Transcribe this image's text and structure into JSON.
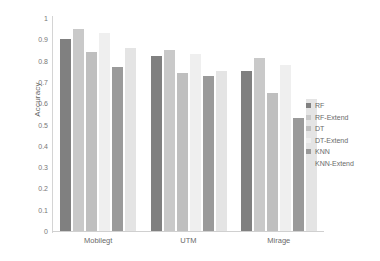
{
  "chart_data": {
    "type": "bar",
    "title": "",
    "xlabel": "",
    "ylabel": "Accuracy",
    "ylim": [
      0,
      1
    ],
    "ytick_labels": [
      "1",
      "0.9",
      "0.8",
      "0.7",
      "0.6",
      "0.5",
      "0.4",
      "0.3",
      "0.2",
      "0.1",
      "0"
    ],
    "ytick_values": [
      1,
      0.9,
      0.8,
      0.7,
      0.6,
      0.5,
      0.4,
      0.3,
      0.2,
      0.1,
      0
    ],
    "grid": false,
    "legend_position": "right",
    "categories": [
      "Mobilegt",
      "UTM",
      "Mirage"
    ],
    "series": [
      {
        "name": "RF",
        "color": "#808080",
        "values": [
          0.9,
          0.82,
          0.75
        ]
      },
      {
        "name": "RF-Extend",
        "color": "#c9c9c9",
        "values": [
          0.95,
          0.85,
          0.81
        ]
      },
      {
        "name": "DT",
        "color": "#bfbfbf",
        "values": [
          0.84,
          0.74,
          0.65
        ]
      },
      {
        "name": "DT-Extend",
        "color": "#efefef",
        "values": [
          0.93,
          0.83,
          0.78
        ]
      },
      {
        "name": "KNN",
        "color": "#9a9a9a",
        "values": [
          0.77,
          0.73,
          0.53
        ]
      },
      {
        "name": "KNN-Extend",
        "color": "#e4e4e4",
        "values": [
          0.86,
          0.75,
          0.62
        ]
      }
    ]
  }
}
